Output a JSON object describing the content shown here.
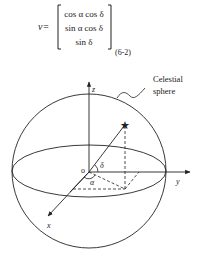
{
  "equation": {
    "lhs": "v=",
    "rows": [
      "cos α cos δ",
      "sin α cos δ",
      "sin δ"
    ],
    "number": "(6-2)"
  },
  "diagram": {
    "axes": {
      "x": "x",
      "y": "y",
      "z": "z"
    },
    "origin_label": "O",
    "angle_labels": {
      "declination": "δ",
      "right_ascension": "α"
    },
    "callout": [
      "Celestial",
      "sphere"
    ],
    "star_icon": "star",
    "line_color": "#222222"
  }
}
